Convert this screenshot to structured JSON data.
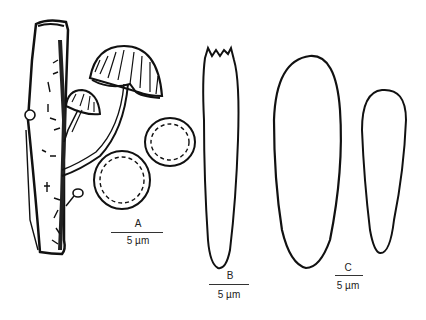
{
  "figure": {
    "panels": [
      {
        "id": "A",
        "label": "A",
        "scale_label": "5 µm",
        "content": "Mushroom fruiting bodies on twig and two spores"
      },
      {
        "id": "B",
        "label": "B",
        "scale_label": "5 µm",
        "content": "Cheilocystidium with apical projections"
      },
      {
        "id": "C",
        "label": "C",
        "scale_label": "5 µm",
        "content": "Two elongated clavate cells"
      }
    ],
    "colors": {
      "ink": "#111111",
      "background": "#ffffff"
    }
  }
}
